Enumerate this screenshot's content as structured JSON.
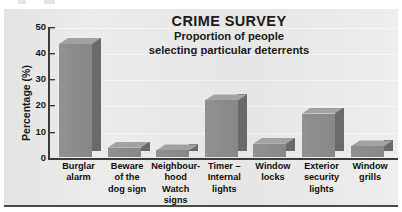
{
  "page": {
    "background_color": "#ffffff",
    "panel_background_color": "#e8e8e6",
    "bar_front_color": "#8b8b8a",
    "bar_side_color": "#6a6a69",
    "bar_top_color": "#a2a2a0",
    "axis_color": "#3b3b3b",
    "text_color": "#1a1a1a"
  },
  "chart_data": {
    "type": "bar",
    "title": "CRIME SURVEY",
    "subtitle_lines": [
      "Proportion of people",
      "selecting particular deterrents"
    ],
    "xlabel": "",
    "ylabel": "Percentage (%)",
    "ylim": [
      0,
      50
    ],
    "yticks": [
      0,
      10,
      20,
      30,
      40,
      50
    ],
    "ytick_labels": [
      "0",
      "10",
      "20",
      "30",
      "40",
      "50"
    ],
    "grid": false,
    "legend": "none",
    "style": "3d-bar",
    "categories": [
      "Burglar alarm",
      "Beware of the dog sign",
      "Neighbourhood Watch signs",
      "Timer – Internal lights",
      "Window locks",
      "Exterior security lights",
      "Window grills"
    ],
    "category_label_lines": [
      [
        "Burglar",
        "alarm"
      ],
      [
        "Beware",
        "of the",
        "dog sign"
      ],
      [
        "Neighbour-",
        "hood",
        "Watch",
        "signs"
      ],
      [
        "Timer –",
        "Internal",
        "lights"
      ],
      [
        "Window",
        "locks"
      ],
      [
        "Exterior",
        "security",
        "lights"
      ],
      [
        "Window",
        "grills"
      ]
    ],
    "values": [
      43,
      3.5,
      2.5,
      21.5,
      5,
      16.5,
      4
    ]
  }
}
